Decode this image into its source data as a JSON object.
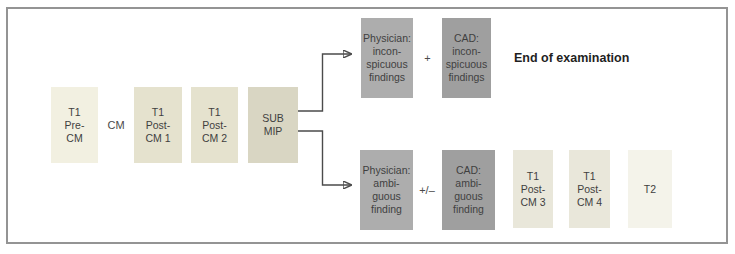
{
  "figure": {
    "background": "#ffffff",
    "frame_border_color": "#949494"
  },
  "colors": {
    "box_cream": "#f2f0e1",
    "box_khaki": "#e5e2ce",
    "box_khaki_dark": "#d9d6c3",
    "box_khaki_light": "#e9e7da",
    "box_pale": "#f4f3ea",
    "box_gray": "#adadad",
    "box_gray_dark": "#9f9f9f",
    "box_text": "#3f3f3f",
    "arrow": "#4b4b4b"
  },
  "sequence": {
    "t1_pre_cm": "T1\nPre-\nCM",
    "cm": "CM",
    "t1_post_cm1": "T1\nPost-\nCM 1",
    "t1_post_cm2": "T1\nPost-\nCM 2",
    "sub_mip": "SUB\nMIP"
  },
  "upper_branch": {
    "physician": "Physician:\nincon-\nspicuous\nfindings",
    "operator": "+",
    "cad": "CAD:\nincon-\nspicuous\nfindings",
    "outcome": "End of examination"
  },
  "lower_branch": {
    "physician": "Physician:\nambi-\nguous\nfinding",
    "operator": "+/–",
    "cad": "CAD:\nambi-\nguous\nfinding",
    "t1_post_cm3": "T1\nPost-\nCM 3",
    "t1_post_cm4": "T1\nPost-\nCM 4",
    "t2": "T2"
  }
}
